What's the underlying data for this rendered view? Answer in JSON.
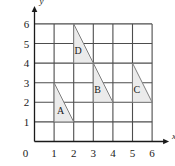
{
  "figure": {
    "background_color": "#ffffff"
  },
  "chart_data": {
    "type": "scatter",
    "title": "",
    "subtitle": "",
    "xlabel": "x",
    "ylabel": "y",
    "xlim": [
      0,
      6
    ],
    "ylim": [
      0,
      6
    ],
    "grid": true,
    "grid_step": 1,
    "grid_color": "#4d4d4d",
    "legend": "none",
    "x_ticks": [
      "0",
      "1",
      "2",
      "3",
      "4",
      "5",
      "6"
    ],
    "y_ticks": [
      "0",
      "1",
      "2",
      "3",
      "4",
      "5",
      "6"
    ],
    "x_tick_values": [
      0,
      1,
      2,
      3,
      4,
      5,
      6
    ],
    "y_tick_values": [
      0,
      1,
      2,
      3,
      4,
      5,
      6
    ],
    "origin_label": "0",
    "shape_fill": "#ebebeb",
    "shape_stroke": "#808080",
    "shapes": [
      {
        "name": "A",
        "kind": "right-triangle",
        "vertices": [
          [
            1,
            3
          ],
          [
            1,
            1
          ],
          [
            2,
            1
          ]
        ],
        "label": "A",
        "label_position": [
          1.33,
          1.42
        ]
      },
      {
        "name": "B",
        "kind": "right-triangle",
        "vertices": [
          [
            3,
            4
          ],
          [
            3,
            2
          ],
          [
            4,
            2
          ]
        ],
        "label": "B",
        "label_position": [
          3.22,
          2.46
        ]
      },
      {
        "name": "C",
        "kind": "right-triangle",
        "vertices": [
          [
            5,
            4
          ],
          [
            5,
            2
          ],
          [
            6,
            2
          ]
        ],
        "label": "C",
        "label_position": [
          5.22,
          2.46
        ]
      },
      {
        "name": "D",
        "kind": "right-triangle",
        "vertices": [
          [
            2,
            6
          ],
          [
            2,
            4
          ],
          [
            3,
            4
          ]
        ],
        "label": "D",
        "label_position": [
          2.22,
          4.46
        ]
      }
    ]
  }
}
